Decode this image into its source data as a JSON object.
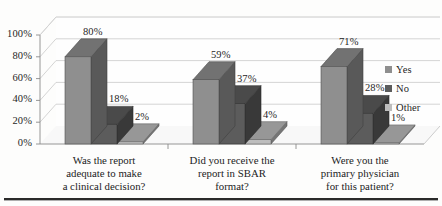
{
  "chart_data": {
    "type": "bar",
    "title": "",
    "subtitle": "",
    "xlabel": "",
    "ylabel": "",
    "ylim": [
      0,
      100
    ],
    "ytick_labels": [
      "0%",
      "20%",
      "40%",
      "60%",
      "80%",
      "100%"
    ],
    "ytick_values": [
      0,
      20,
      40,
      60,
      80,
      100
    ],
    "grid": true,
    "three_d": true,
    "legend_position": "right",
    "value_suffix": "%",
    "categories": [
      "Was the report\nadequate to make\na clinical decision?",
      "Did you receive the\nreport in SBAR\nformat?",
      "Were you the\nprimary physician\nfor this patient?"
    ],
    "series": [
      {
        "name": "Yes",
        "color": "#8f8f8f",
        "values": [
          80,
          59,
          71
        ]
      },
      {
        "name": "No",
        "color": "#5c5c5c",
        "values": [
          18,
          37,
          28
        ]
      },
      {
        "name": "Other",
        "color": "#bdbdbd",
        "values": [
          2,
          4,
          1
        ]
      }
    ],
    "data_labels": [
      [
        "80%",
        "18%",
        "2%"
      ],
      [
        "59%",
        "37%",
        "4%"
      ],
      [
        "71%",
        "28%",
        "1%"
      ]
    ]
  },
  "legend": {
    "items": [
      {
        "label": "Yes",
        "color": "#8f8f8f"
      },
      {
        "label": "No",
        "color": "#5c5c5c"
      },
      {
        "label": "Other",
        "color": "#bdbdbd"
      }
    ]
  },
  "colors": {
    "grid": "#c9c9c9",
    "axis": "#8a8a8a",
    "wall": "#fefefe",
    "floor": "#f7f7f7",
    "rule": "#2a2a2a",
    "text": "#1c1c1c"
  }
}
